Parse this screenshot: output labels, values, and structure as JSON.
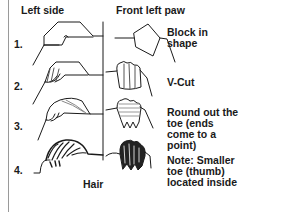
{
  "headers": {
    "left": "Left side",
    "right": "Front left paw"
  },
  "steps": [
    {
      "number": "1.",
      "note": "Block in\nshape"
    },
    {
      "number": "2.",
      "note": "V-Cut"
    },
    {
      "number": "3.",
      "note": "Round out the\ntoe (ends\ncome to a\npoint)"
    },
    {
      "number": "4.",
      "note": "Note: Smaller\ntoe (thumb)\nlocated inside"
    }
  ],
  "caption": "Hair",
  "colors": {
    "ink": "#1a1a1a",
    "border": "#9a9a9a",
    "background": "#ffffff"
  }
}
